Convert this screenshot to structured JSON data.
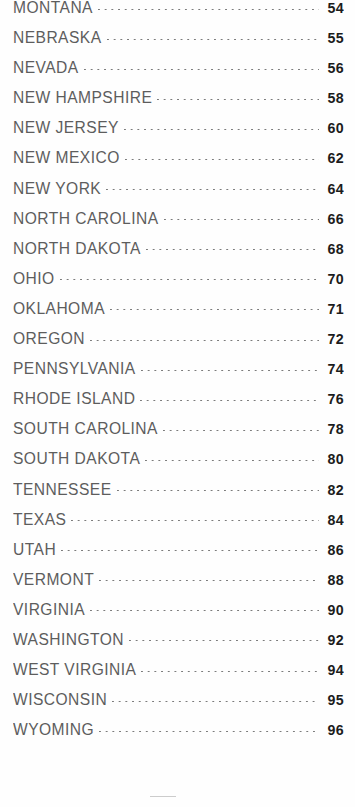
{
  "page": {
    "type": "index-listing",
    "background_color": "#fefefe",
    "label_color": "#5d5d5d",
    "page_number_color": "#1c1c1c",
    "leader_dot_color": "#7b7b7b",
    "footer_rule_color": "#b9b9b9"
  },
  "entries": [
    {
      "label": "MONTANA",
      "page": "54"
    },
    {
      "label": "NEBRASKA",
      "page": "55"
    },
    {
      "label": "NEVADA",
      "page": "56"
    },
    {
      "label": "NEW HAMPSHIRE",
      "page": "58"
    },
    {
      "label": "NEW JERSEY",
      "page": "60"
    },
    {
      "label": "NEW MEXICO",
      "page": "62"
    },
    {
      "label": "NEW YORK",
      "page": "64"
    },
    {
      "label": "NORTH CAROLINA",
      "page": "66"
    },
    {
      "label": "NORTH DAKOTA",
      "page": "68"
    },
    {
      "label": "OHIO",
      "page": "70"
    },
    {
      "label": "OKLAHOMA",
      "page": "71"
    },
    {
      "label": "OREGON",
      "page": "72"
    },
    {
      "label": "PENNSYLVANIA",
      "page": "74"
    },
    {
      "label": "RHODE ISLAND",
      "page": "76"
    },
    {
      "label": "SOUTH CAROLINA",
      "page": "78"
    },
    {
      "label": "SOUTH DAKOTA",
      "page": "80"
    },
    {
      "label": "TENNESSEE",
      "page": "82"
    },
    {
      "label": "TEXAS",
      "page": "84"
    },
    {
      "label": "UTAH",
      "page": "86"
    },
    {
      "label": "VERMONT",
      "page": "88"
    },
    {
      "label": "VIRGINIA",
      "page": "90"
    },
    {
      "label": "WASHINGTON",
      "page": "92"
    },
    {
      "label": "WEST VIRGINIA",
      "page": "94"
    },
    {
      "label": "WISCONSIN",
      "page": "95"
    },
    {
      "label": "WYOMING",
      "page": "96"
    }
  ]
}
